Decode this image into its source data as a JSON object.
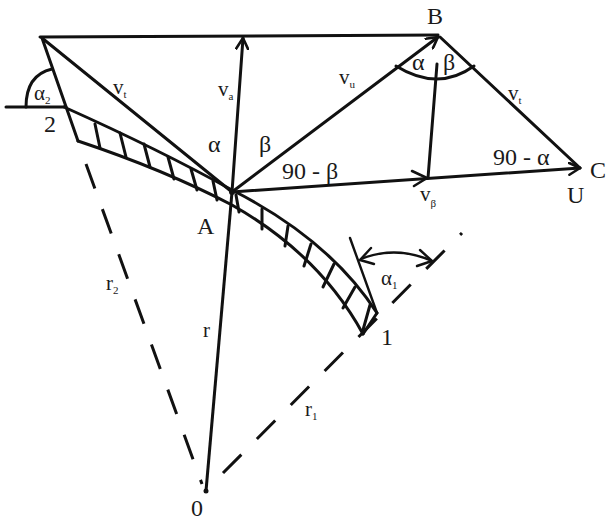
{
  "diagram": {
    "type": "velocity-triangle / blade geometry",
    "colors": {
      "ink": "#111111",
      "background": "#ffffff"
    },
    "points": {
      "A": "A",
      "B": "B",
      "C": "C",
      "U": "U",
      "O": "0",
      "point1": "1",
      "point2": "2"
    },
    "vectors": {
      "v_t": {
        "base": "v",
        "sub": "t"
      },
      "v_a": {
        "base": "v",
        "sub": "a"
      },
      "v_u": {
        "base": "v",
        "sub": "u"
      },
      "v_t_right": {
        "base": "v",
        "sub": "t"
      },
      "v_beta": {
        "base": "v",
        "sub": "β"
      }
    },
    "radii": {
      "r": "r",
      "r1": {
        "base": "r",
        "sub": "1"
      },
      "r2": {
        "base": "r",
        "sub": "2"
      }
    },
    "angles": {
      "alpha_at_A": "α",
      "beta_at_A": "β",
      "ninety_minus_beta": "90 - β",
      "alpha_at_B": "α",
      "beta_at_B": "β",
      "ninety_minus_alpha": "90 - α",
      "alpha1": {
        "base": "α",
        "sub": "1"
      },
      "alpha2": {
        "base": "α",
        "sub": "2"
      }
    }
  }
}
